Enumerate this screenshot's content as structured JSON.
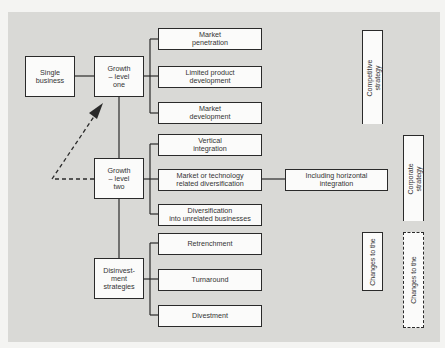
{
  "diagram": {
    "nodes": {
      "single_business": "Single\nbusiness",
      "growth_one": "Growth\n– level\none",
      "growth_two": "Growth\n– level\ntwo",
      "disinvestment": "Disinvest-\nment\nstrategies",
      "market_penetration": "Market\npenetration",
      "limited_product_development": "Limited product\ndevelopment",
      "market_development": "Market\ndevelopment",
      "vertical_integration": "Vertical\nintegration",
      "market_tech_diversification": "Market or technology\nrelated diversification",
      "unrelated_diversification": "Diversification\ninto unrelated businesses",
      "horizontal_integration": "Including horizontal\nintegration",
      "retrenchment": "Retrenchment",
      "turnaround": "Turnaround",
      "divestment": "Divestment"
    },
    "side_labels": {
      "competitive_strategy": "Competitive\nstrategy",
      "corporate_strategy": "Corporate\nstrategy",
      "changes_solid": "Changes to the",
      "changes_dashed": "Changes to the"
    },
    "colors": {
      "background": "#d9d9d6",
      "box_fill": "#fbfbfa",
      "line": "#2a2a2a"
    }
  }
}
